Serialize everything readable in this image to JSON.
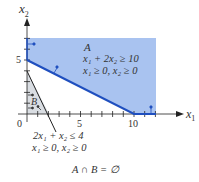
{
  "figure": {
    "y_axis_label": "x",
    "y_axis_sub": "2",
    "x_axis_label": "x",
    "x_axis_sub": "1",
    "tick_labels": {
      "origin": "0",
      "x5": "5",
      "x10": "10",
      "y5": "5"
    },
    "region_a": {
      "name": "A",
      "constraint1": "x₁ + 2x₂ ≥ 10",
      "constraint2": "x₁ ≥ 0, x₂ ≥ 0",
      "fill": "#a9c3f0",
      "boundary_color": "#1f4fbf"
    },
    "region_b": {
      "name": "B",
      "constraint1": "2x₁ + x₂ ≤ 4",
      "constraint2": "x₁ ≥ 0, x₂ ≥ 0",
      "fill": "#d9dde2"
    },
    "caption": "A ∩ B = ∅"
  }
}
